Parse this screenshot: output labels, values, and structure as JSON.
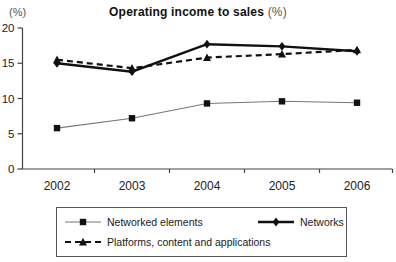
{
  "chart": {
    "y_unit_label": "(%)",
    "title_main": "Operating income to sales",
    "title_suffix": " (%)"
  },
  "chart_data": {
    "type": "line",
    "title": "Operating income to sales (%)",
    "categories": [
      "2002",
      "2003",
      "2004",
      "2005",
      "2006"
    ],
    "series": [
      {
        "name": "Networked elements",
        "values": [
          5.8,
          7.2,
          9.3,
          9.6,
          9.4
        ],
        "marker": "square",
        "line_style": "solid-thin",
        "line_color": "#777777",
        "marker_color": "#111111"
      },
      {
        "name": "Networks",
        "values": [
          15.0,
          13.8,
          17.7,
          17.4,
          16.7
        ],
        "marker": "diamond",
        "line_style": "solid-thick",
        "line_color": "#111111",
        "marker_color": "#111111"
      },
      {
        "name": "Platforms, content and applications",
        "values": [
          15.5,
          14.3,
          15.8,
          16.3,
          16.9
        ],
        "marker": "triangle",
        "line_style": "dashed",
        "line_color": "#111111",
        "marker_color": "#111111"
      }
    ],
    "ylim": [
      0,
      20
    ],
    "y_ticks": [
      0,
      5,
      10,
      15,
      20
    ],
    "grid": false,
    "legend_position": "bottom-box"
  }
}
